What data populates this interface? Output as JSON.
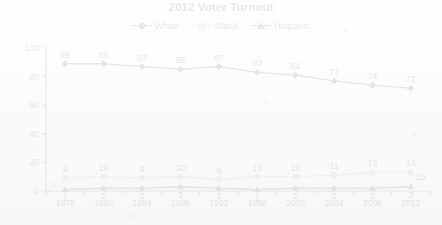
{
  "chart_data": {
    "type": "line",
    "title": "2012 Voter Turnout",
    "xlabel": "",
    "ylabel": "",
    "categories": [
      "1976",
      "1980",
      "1984",
      "1988",
      "1992",
      "1996",
      "2000",
      "2004",
      "2008",
      "2012"
    ],
    "ylim": [
      0,
      100
    ],
    "yticks": [
      "0",
      "20",
      "40",
      "60",
      "80",
      "100"
    ],
    "grid": false,
    "legend_position": "top-center",
    "series": [
      {
        "name": "White",
        "marker": "diamond",
        "color": "#111111",
        "values": [
          89,
          89,
          87,
          85,
          87,
          83,
          81,
          77,
          74,
          72
        ],
        "labels": [
          "89",
          "89",
          "87",
          "85",
          "87",
          "83",
          "81",
          "77",
          "74",
          "72"
        ]
      },
      {
        "name": "Black",
        "marker": "square",
        "color": "#9c9c9c",
        "values": [
          9,
          10,
          9,
          10,
          8,
          10,
          10,
          11,
          13,
          13
        ],
        "labels": [
          "9",
          "10",
          "9",
          "10",
          "8",
          "10",
          "10",
          "11",
          "13",
          "13"
        ]
      },
      {
        "name": "Hispanic",
        "marker": "triangle",
        "color": "#181818",
        "values": [
          1,
          2,
          2,
          3,
          2,
          1,
          2,
          2,
          2,
          3
        ],
        "labels": [
          "1",
          "2",
          "2",
          "3",
          "2",
          "1",
          "2",
          "2",
          "2",
          "3"
        ],
        "end_label": "10"
      }
    ]
  },
  "legend": {
    "items": [
      {
        "label": "White",
        "marker": "diamond"
      },
      {
        "label": "Black",
        "marker": "square"
      },
      {
        "label": "Hispanic",
        "marker": "triangle"
      }
    ]
  }
}
